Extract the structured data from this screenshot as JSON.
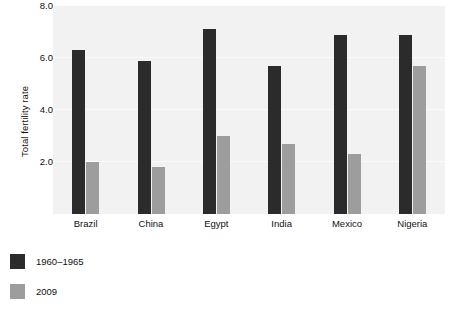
{
  "chart_data": {
    "type": "bar",
    "title": "",
    "xlabel": "",
    "ylabel": "Total fertility rate",
    "categories": [
      "Brazil",
      "China",
      "Egypt",
      "India",
      "Mexico",
      "Nigeria"
    ],
    "series": [
      {
        "name": "1960–1965",
        "color": "#2b2b2b",
        "values": [
          6.3,
          5.9,
          7.1,
          5.7,
          6.9,
          6.9
        ]
      },
      {
        "name": "2009",
        "color": "#9d9d9d",
        "values": [
          2.0,
          1.8,
          3.0,
          2.7,
          2.3,
          5.7
        ]
      }
    ],
    "ylim": [
      0,
      8.0
    ],
    "yticks": [
      2.0,
      4.0,
      6.0,
      8.0
    ],
    "ytick_labels": [
      "2.0",
      "4.0",
      "6.0",
      "8.0"
    ],
    "grid": true,
    "legend_position": "below-left",
    "plot_background": "#f2f2f2"
  }
}
